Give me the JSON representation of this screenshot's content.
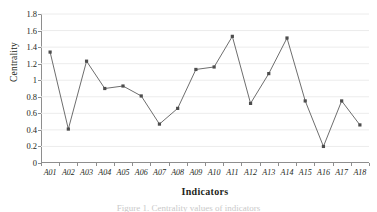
{
  "chart_data": {
    "type": "line",
    "title": "",
    "xlabel": "Indicators",
    "ylabel": "Centrality",
    "categories": [
      "A01",
      "A02",
      "A03",
      "A04",
      "A05",
      "A06",
      "A07",
      "A08",
      "A09",
      "A10",
      "A11",
      "A12",
      "A13",
      "A14",
      "A15",
      "A16",
      "A17",
      "A18"
    ],
    "values": [
      1.34,
      0.41,
      1.23,
      0.9,
      0.93,
      0.81,
      0.47,
      0.66,
      1.13,
      1.16,
      1.53,
      0.72,
      1.08,
      1.51,
      0.75,
      0.2,
      0.75,
      0.46
    ],
    "series": [
      {
        "name": "Centrality",
        "values": [
          1.34,
          0.41,
          1.23,
          0.9,
          0.93,
          0.81,
          0.47,
          0.66,
          1.13,
          1.16,
          1.53,
          0.72,
          1.08,
          1.51,
          0.75,
          0.2,
          0.75,
          0.46
        ]
      }
    ],
    "ylim": [
      0,
      1.8
    ],
    "yticks": [
      0,
      0.2,
      0.4,
      0.6,
      0.8,
      1,
      1.2,
      1.4,
      1.6,
      1.8
    ],
    "ytick_labels": [
      "0",
      "0.2",
      "0.4",
      "0.6",
      "0.8",
      "1",
      "1.2",
      "1.4",
      "1.6",
      "1.8"
    ],
    "grid": "horizontal",
    "legend": "none",
    "line_color": "#6e6e6e",
    "marker_color": "#4d4d4d",
    "marker_shape": "square",
    "grid_color": "#ececec",
    "axis_color": "#8e8e8e"
  },
  "caption": {
    "text": "Figure 1. Centrality values of indicators"
  }
}
